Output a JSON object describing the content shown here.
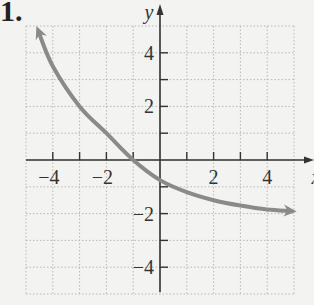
{
  "problem_number": "1.",
  "chart_data": {
    "type": "line",
    "title": "",
    "xlabel": "x",
    "ylabel": "y",
    "xlim": [
      -5,
      5
    ],
    "ylim": [
      -5,
      5
    ],
    "grid": true,
    "x_tick_labels": [
      "-4",
      "-2",
      "2",
      "4"
    ],
    "y_tick_labels": [
      "4",
      "2",
      "-2",
      "-4"
    ],
    "series": [
      {
        "name": "curve",
        "color": "#8a8a8a",
        "x": [
          -4.5,
          -4,
          -3,
          -2,
          -1,
          0,
          1,
          2,
          3,
          4,
          4.8
        ],
        "y": [
          4.7,
          3.5,
          2.0,
          1.0,
          0.0,
          -0.75,
          -1.2,
          -1.5,
          -1.7,
          -1.85,
          -1.9
        ],
        "arrows": "both"
      }
    ]
  }
}
